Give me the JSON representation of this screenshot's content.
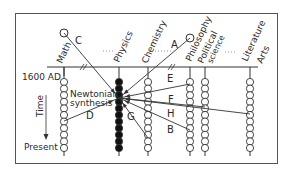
{
  "frame": {
    "x": 15,
    "y": 13,
    "w": 263,
    "h": 151
  },
  "baseline_y": 67,
  "start_label": "1600 AD",
  "end_label": "Present",
  "axis_label": "Time",
  "center_label_1": "Newtonian",
  "center_label_2": "synthesis",
  "columns": [
    {
      "id": "math",
      "label": "Math",
      "x": 64,
      "filled": false,
      "beads": 11
    },
    {
      "id": "physics",
      "label": "Physics",
      "x": 119,
      "filled": true,
      "beads": 11
    },
    {
      "id": "chemistry",
      "label": "Chemistry",
      "x": 148,
      "filled": false,
      "beads": 11
    },
    {
      "id": "philosophy",
      "label": "Philosophy",
      "x": 190,
      "filled": false,
      "beads": 11
    },
    {
      "id": "political-science",
      "label": "Political science",
      "x": 205,
      "filled": false,
      "beads": 11
    },
    {
      "id": "literature-arts",
      "label": "Literature Arts",
      "x": 250,
      "filled": false,
      "beads": 11
    }
  ],
  "arrows": [
    {
      "label": "A",
      "from": [
        190,
        38
      ],
      "to": [
        119,
        98
      ]
    },
    {
      "label": "C",
      "from": [
        64,
        33
      ],
      "to": [
        119,
        98
      ]
    },
    {
      "label": "D",
      "from": [
        64,
        121
      ],
      "to": [
        119,
        98
      ]
    },
    {
      "label": "E",
      "from": [
        190,
        84
      ],
      "to": [
        119,
        98
      ]
    },
    {
      "label": "F",
      "from": [
        205,
        107
      ],
      "to": [
        119,
        98
      ]
    },
    {
      "label": "G",
      "from": [
        148,
        138
      ],
      "to": [
        119,
        98
      ]
    },
    {
      "label": "H",
      "from": [
        250,
        114
      ],
      "to": [
        119,
        98
      ]
    },
    {
      "label": "B",
      "from": [
        190,
        130
      ],
      "to": [
        119,
        98
      ]
    }
  ]
}
